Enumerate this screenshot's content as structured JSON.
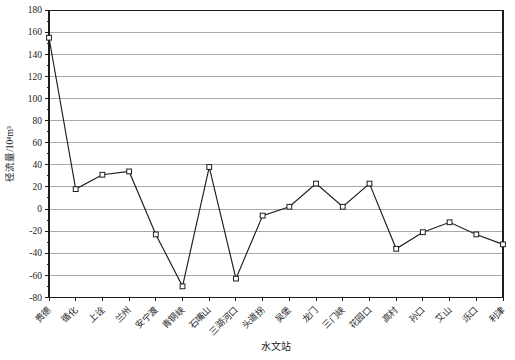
{
  "chart": {
    "xlabel": "水文站",
    "ylabel": "径流量/10⁸m³"
  },
  "chart_data": {
    "type": "line",
    "title": "",
    "categories": [
      "贵德",
      "循化",
      "上诠",
      "兰州",
      "安宁渡",
      "青铜峡",
      "石嘴山",
      "三湖河口",
      "头道拐",
      "吴堡",
      "龙门",
      "三门峡",
      "花园口",
      "高村",
      "孙口",
      "艾山",
      "泺口",
      "利津"
    ],
    "values": [
      155,
      18,
      31,
      34,
      -23,
      -70,
      38,
      -63,
      -6,
      2,
      23,
      2,
      23,
      -36,
      -21,
      -12,
      -23,
      -32
    ],
    "xlabel": "水文站",
    "ylabel": "径流量/10⁸m³",
    "ylim": [
      -80,
      180
    ],
    "ytick_step": 20,
    "yminor_step": 10,
    "grid": true,
    "legend": "none",
    "marker": "open-square",
    "colors": {
      "line": "#1c1c1c",
      "axis": "#1c1c1c",
      "grid": "#a8a8a8",
      "marker_fill": "#ffffff",
      "text": "#1c1c1c",
      "background": "#ffffff"
    }
  }
}
